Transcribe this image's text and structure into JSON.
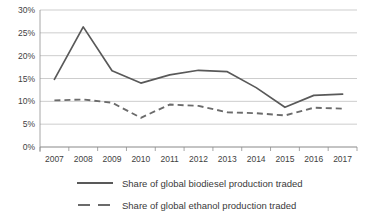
{
  "chart_data": {
    "type": "line",
    "title": "",
    "subtitle": "",
    "xlabel": "",
    "ylabel": "",
    "categories": [
      "2007",
      "2008",
      "2009",
      "2010",
      "2011",
      "2012",
      "2013",
      "2014",
      "2015",
      "2016",
      "2017"
    ],
    "x": [
      2007,
      2008,
      2009,
      2010,
      2011,
      2012,
      2013,
      2014,
      2015,
      2016,
      2017
    ],
    "ylim": [
      0,
      30
    ],
    "ytick_labels": [
      "0%",
      "5%",
      "10%",
      "15%",
      "20%",
      "25%",
      "30%"
    ],
    "ytick_values": [
      0,
      5,
      10,
      15,
      20,
      25,
      30
    ],
    "grid": true,
    "legend_position": "bottom",
    "series": [
      {
        "name": "Share of global biodiesel production traded",
        "style": "solid",
        "color": "#595959",
        "values": [
          14.8,
          26.3,
          16.7,
          14.0,
          15.8,
          16.8,
          16.5,
          13.0,
          8.7,
          11.3,
          11.6
        ]
      },
      {
        "name": "Share of global ethanol production traded",
        "style": "dashed",
        "color": "#6b6b6b",
        "values": [
          10.2,
          10.4,
          9.7,
          6.4,
          9.3,
          9.0,
          7.6,
          7.4,
          6.9,
          8.6,
          8.4
        ]
      }
    ]
  },
  "legend": {
    "items": [
      {
        "label": "Share of global biodiesel production traded",
        "style": "solid"
      },
      {
        "label": "Share of global ethanol production traded",
        "style": "dashed"
      }
    ]
  }
}
